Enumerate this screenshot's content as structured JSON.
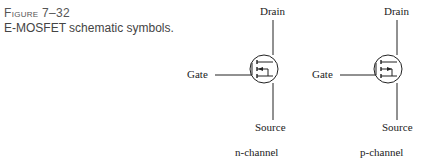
{
  "figure": {
    "label": "Figure 7–32",
    "title": "E-MOSFET schematic symbols."
  },
  "symbols": [
    {
      "type": "n-channel",
      "caption": "n-channel",
      "terminals": {
        "drain": "Drain",
        "gate": "Gate",
        "source": "Source"
      }
    },
    {
      "type": "p-channel",
      "caption": "p-channel",
      "terminals": {
        "drain": "Drain",
        "gate": "Gate",
        "source": "Source"
      }
    }
  ],
  "colors": {
    "line": "#222222",
    "caption": "#555555"
  }
}
